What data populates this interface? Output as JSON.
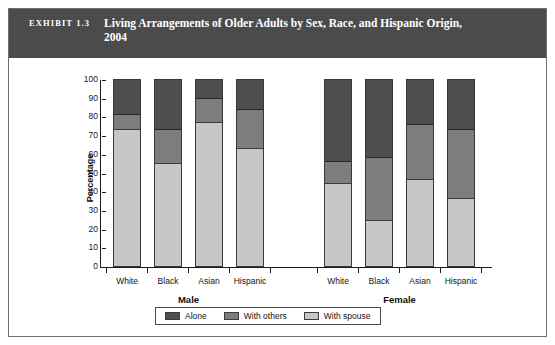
{
  "exhibit": {
    "label": "EXHIBIT 1.3",
    "title": "Living Arrangements of Older Adults by Sex, Race, and Hispanic Origin, 2004"
  },
  "colors": {
    "header_band": "#4b4b4b",
    "alone": "#4e4e4e",
    "with_others": "#7d7d7d",
    "with_spouse": "#c7c7c7",
    "axis": "#1c1c1c",
    "border": "#6e6e6e"
  },
  "chart_data": {
    "type": "bar",
    "stacked": true,
    "title": "Living Arrangements of Older Adults by Sex, Race, and Hispanic Origin, 2004",
    "xlabel": "",
    "ylabel": "Percentage",
    "ylim": [
      0,
      100
    ],
    "yticks": [
      0,
      10,
      20,
      30,
      40,
      50,
      60,
      70,
      80,
      90,
      100
    ],
    "ytick_labels": [
      "0",
      "10",
      "20",
      "30",
      "40",
      "50",
      "60",
      "70",
      "80",
      "90",
      "100"
    ],
    "grid": false,
    "legend_position": "bottom",
    "groups": [
      {
        "label": "Male",
        "categories": [
          "White",
          "Black",
          "Asian",
          "Hispanic"
        ]
      },
      {
        "label": "Female",
        "categories": [
          "White",
          "Black",
          "Asian",
          "Hispanic"
        ]
      }
    ],
    "categories": [
      "White",
      "Black",
      "Asian",
      "Hispanic",
      "White",
      "Black",
      "Asian",
      "Hispanic"
    ],
    "series": [
      {
        "name": "With spouse",
        "color": "#c7c7c7",
        "values": [
          73,
          55,
          77,
          63,
          44,
          24,
          46,
          36
        ]
      },
      {
        "name": "With others",
        "color": "#7d7d7d",
        "values": [
          8,
          18,
          13,
          21,
          12,
          34,
          30,
          37
        ]
      },
      {
        "name": "Alone",
        "color": "#4e4e4e",
        "values": [
          19,
          27,
          10,
          16,
          44,
          42,
          24,
          27
        ]
      }
    ],
    "bars": [
      {
        "group": "Male",
        "category": "White",
        "with_spouse": 73,
        "with_others": 8,
        "alone": 19
      },
      {
        "group": "Male",
        "category": "Black",
        "with_spouse": 55,
        "with_others": 18,
        "alone": 27
      },
      {
        "group": "Male",
        "category": "Asian",
        "with_spouse": 77,
        "with_others": 13,
        "alone": 10
      },
      {
        "group": "Male",
        "category": "Hispanic",
        "with_spouse": 63,
        "with_others": 21,
        "alone": 16
      },
      {
        "group": "Female",
        "category": "White",
        "with_spouse": 44,
        "with_others": 12,
        "alone": 44
      },
      {
        "group": "Female",
        "category": "Black",
        "with_spouse": 24,
        "with_others": 34,
        "alone": 42
      },
      {
        "group": "Female",
        "category": "Asian",
        "with_spouse": 46,
        "with_others": 30,
        "alone": 24
      },
      {
        "group": "Female",
        "category": "Hispanic",
        "with_spouse": 36,
        "with_others": 37,
        "alone": 27
      }
    ],
    "legend": [
      {
        "label": "Alone",
        "color": "#4e4e4e"
      },
      {
        "label": "With others",
        "color": "#7d7d7d"
      },
      {
        "label": "With spouse",
        "color": "#c7c7c7"
      }
    ]
  }
}
